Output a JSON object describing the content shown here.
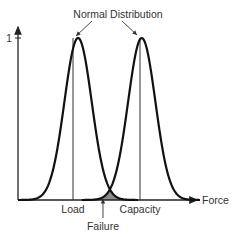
{
  "title": "Normal Distribution",
  "axes": {
    "y_tick_label": "1",
    "x_axis_label": "Force"
  },
  "labels": {
    "load": "Load",
    "capacity": "Capacity",
    "failure": "Failure"
  },
  "chart_data": {
    "type": "line",
    "title": "Normal Distribution",
    "xlabel": "Force",
    "ylabel": "",
    "y_ticks": [
      "1"
    ],
    "series": [
      {
        "name": "Load",
        "mean": 0.33,
        "peak": 1,
        "sigma": 0.075
      },
      {
        "name": "Capacity",
        "mean": 0.68,
        "peak": 1,
        "sigma": 0.075
      }
    ],
    "annotations": [
      {
        "text": "Normal Distribution",
        "points_to": [
          "Load peak",
          "Capacity peak"
        ]
      },
      {
        "text": "Failure",
        "points_to": "overlap region (shaded)"
      }
    ],
    "shaded_region": {
      "name": "Failure",
      "color": "#888888"
    },
    "colors": {
      "curve": "#111111",
      "axis": "#222222",
      "shade": "#8a8a8a"
    }
  }
}
